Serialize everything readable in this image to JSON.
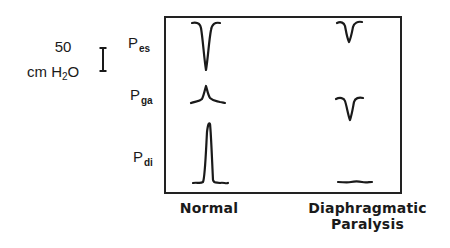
{
  "scale_bar": {
    "value": "50",
    "unit_prefix": "cm H",
    "unit_subscript": "2",
    "unit_suffix": "O"
  },
  "rows": [
    {
      "id": "pes",
      "symbol": "P",
      "subscript": "es"
    },
    {
      "id": "pga",
      "symbol": "P",
      "subscript": "ga"
    },
    {
      "id": "pdi",
      "symbol": "P",
      "subscript": "di"
    }
  ],
  "columns": [
    {
      "id": "normal",
      "label": "Normal"
    },
    {
      "id": "paralysis",
      "label_line1": "Diaphragmatic",
      "label_line2": "Paralysis"
    }
  ],
  "traces": {
    "normal": {
      "pes": "deep negative deflection",
      "pga": "small positive deflection",
      "pdi": "large positive deflection"
    },
    "paralysis": {
      "pes": "small negative deflection",
      "pga": "negative deflection",
      "pdi": "flat (no deflection)"
    }
  },
  "colors": {
    "ink": "#1a1a1a",
    "background": "#ffffff"
  }
}
